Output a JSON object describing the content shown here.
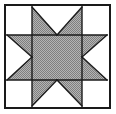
{
  "figure": {
    "title": "Eight-Pointed Star Quilt Block",
    "type": "quilt-block-diagram",
    "width": 116,
    "height": 114,
    "background_color": "#ffffff"
  },
  "colors": {
    "background": "#ffffff",
    "patch_light": "#ffffff",
    "patch_shaded": "#9d9d9d",
    "outline": "#1a1a1a",
    "frame": "#1a1a1a"
  },
  "frame": {
    "name": "outer-border",
    "x": 5,
    "y": 5,
    "width": 105,
    "height": 103,
    "stroke_width": 2
  },
  "grid": {
    "columns": 3,
    "rows": 3,
    "x_divisions": [
      7,
      32,
      82,
      107
    ],
    "y_divisions": [
      7,
      35,
      80,
      106
    ],
    "line_width": 1.4
  },
  "patches": [
    {
      "name": "corner-top-left",
      "cell": "r0c0",
      "shade": "light",
      "shape": "square",
      "points": "7,7 32,7 32,35 7,35"
    },
    {
      "name": "star-point-top-left-half",
      "cell": "r0c1",
      "shade": "shaded",
      "shape": "triangle",
      "points": "32,7 57,35 32,35"
    },
    {
      "name": "star-point-top-notch",
      "cell": "r0c1",
      "shade": "light",
      "shape": "triangle",
      "points": "32,7 82,7 57,35"
    },
    {
      "name": "star-point-top-right-half",
      "cell": "r0c1",
      "shade": "shaded",
      "shape": "triangle",
      "points": "82,7 82,35 57,35"
    },
    {
      "name": "corner-top-right",
      "cell": "r0c2",
      "shade": "light",
      "shape": "square",
      "points": "82,7 107,7 107,35 82,35"
    },
    {
      "name": "star-point-left-upper-half",
      "cell": "r1c0",
      "shade": "shaded",
      "shape": "triangle",
      "points": "7,35 32,35 32,57"
    },
    {
      "name": "star-point-left-notch",
      "cell": "r1c0",
      "shade": "light",
      "shape": "triangle",
      "points": "7,35 32,57 7,80"
    },
    {
      "name": "star-point-left-lower-half",
      "cell": "r1c0",
      "shade": "shaded",
      "shape": "triangle",
      "points": "7,80 32,57 32,80"
    },
    {
      "name": "center-square",
      "cell": "r1c1",
      "shade": "shaded",
      "shape": "square",
      "points": "32,35 82,35 82,80 32,80"
    },
    {
      "name": "star-point-right-upper-half",
      "cell": "r1c2",
      "shade": "shaded",
      "shape": "triangle",
      "points": "82,35 107,35 82,57"
    },
    {
      "name": "star-point-right-notch",
      "cell": "r1c2",
      "shade": "light",
      "shape": "triangle",
      "points": "107,35 107,80 82,57"
    },
    {
      "name": "star-point-right-lower-half",
      "cell": "r1c2",
      "shade": "shaded",
      "shape": "triangle",
      "points": "82,57 107,80 82,80"
    },
    {
      "name": "corner-bottom-left",
      "cell": "r2c0",
      "shade": "light",
      "shape": "square",
      "points": "7,80 32,80 32,106 7,106"
    },
    {
      "name": "star-point-bottom-left-half",
      "cell": "r2c1",
      "shade": "shaded",
      "shape": "triangle",
      "points": "32,80 57,80 32,106"
    },
    {
      "name": "star-point-bottom-notch",
      "cell": "r2c1",
      "shade": "light",
      "shape": "triangle",
      "points": "32,106 57,80 82,106"
    },
    {
      "name": "star-point-bottom-right-half",
      "cell": "r2c1",
      "shade": "shaded",
      "shape": "triangle",
      "points": "57,80 82,80 82,106"
    },
    {
      "name": "corner-bottom-right",
      "cell": "r2c2",
      "shade": "light",
      "shape": "square",
      "points": "82,80 107,80 107,106 82,106"
    }
  ],
  "outlines": [
    {
      "name": "grid-line-vertical-left",
      "points": "32,7 32,106"
    },
    {
      "name": "grid-line-vertical-right",
      "points": "82,7 82,106"
    },
    {
      "name": "grid-line-horizontal-top",
      "points": "7,35 107,35"
    },
    {
      "name": "grid-line-horizontal-bottom",
      "points": "7,80 107,80"
    },
    {
      "name": "diagonal-top-left",
      "points": "32,7 57,35"
    },
    {
      "name": "diagonal-top-right",
      "points": "82,7 57,35"
    },
    {
      "name": "diagonal-left-upper",
      "points": "7,35 32,57"
    },
    {
      "name": "diagonal-left-lower",
      "points": "7,80 32,57"
    },
    {
      "name": "diagonal-right-upper",
      "points": "107,35 82,57"
    },
    {
      "name": "diagonal-right-lower",
      "points": "107,80 82,57"
    },
    {
      "name": "diagonal-bottom-left",
      "points": "32,106 57,80"
    },
    {
      "name": "diagonal-bottom-right",
      "points": "82,106 57,80"
    }
  ]
}
